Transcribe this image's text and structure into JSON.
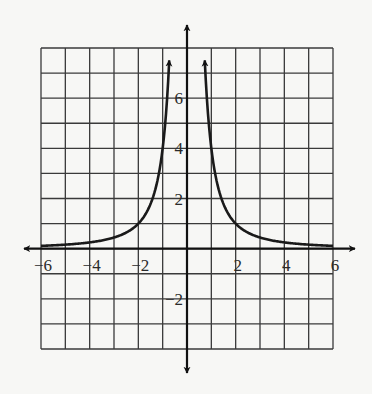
{
  "chart_data": {
    "type": "line",
    "title": "",
    "xlabel": "",
    "ylabel": "",
    "function": "y = 4/x^2",
    "xlim": [
      -6,
      6
    ],
    "ylim": [
      -4,
      8
    ],
    "grid": true,
    "grid_step": 1,
    "x_ticks": [
      -6,
      -4,
      -2,
      2,
      4,
      6
    ],
    "x_tick_labels": [
      "−6",
      "−4",
      "−2",
      "2",
      "4",
      "6"
    ],
    "y_ticks": [
      -2,
      2,
      4,
      6
    ],
    "y_tick_labels": [
      "−2",
      "2",
      "4",
      "6"
    ],
    "series": [
      {
        "name": "left branch",
        "x": [
          -6,
          -5,
          -4,
          -3,
          -2,
          -1.5,
          -1,
          -0.8,
          -0.73
        ],
        "y": [
          0.11,
          0.16,
          0.25,
          0.44,
          1,
          1.78,
          4,
          6.25,
          7.5
        ]
      },
      {
        "name": "right branch",
        "x": [
          0.73,
          0.8,
          1,
          1.5,
          2,
          3,
          4,
          5,
          6
        ],
        "y": [
          7.5,
          6.25,
          4,
          1.78,
          1,
          0.44,
          0.25,
          0.16,
          0.11
        ]
      }
    ],
    "asymptotes": {
      "vertical": 0,
      "horizontal": 0
    },
    "colors": {
      "curve": "#1a1a1a",
      "grid": "#3a3a3a",
      "axes": "#111111",
      "background": "#f7f7f5"
    }
  }
}
